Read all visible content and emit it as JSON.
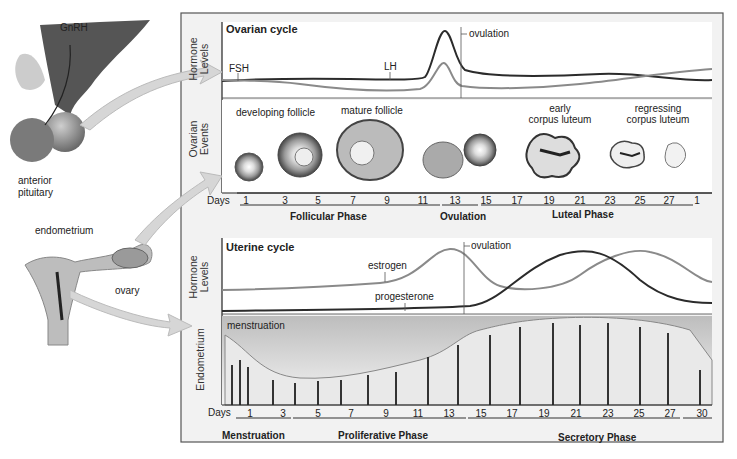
{
  "anatomy": {
    "brain": {
      "gnrh": "GnRH",
      "pituitary_line1": "anterior",
      "pituitary_line2": "pituitary"
    },
    "uterus": {
      "endometrium": "endometrium",
      "ovary": "ovary"
    }
  },
  "ovarian_panel": {
    "title": "Ovarian cycle",
    "axis_hormone": [
      "Hormone",
      "Levels"
    ],
    "axis_events": [
      "Ovarian",
      "Events"
    ],
    "labels": {
      "fsh": "FSH",
      "lh": "LH",
      "ovulation": "ovulation"
    },
    "events": {
      "developing": "developing follicle",
      "mature": "mature follicle",
      "early_cl_1": "early",
      "early_cl_2": "corpus luteum",
      "regress_1": "regressing",
      "regress_2": "corpus luteum"
    },
    "days_label": "Days",
    "days": [
      "1",
      "3",
      "5",
      "7",
      "9",
      "11",
      "13",
      "15",
      "17",
      "19",
      "21",
      "23",
      "25",
      "27",
      "1"
    ],
    "phases": [
      "Follicular Phase",
      "Ovulation",
      "Luteal Phase"
    ]
  },
  "uterine_panel": {
    "title": "Uterine cycle",
    "axis_hormone": [
      "Hormone",
      "Levels"
    ],
    "axis_endometrium": "Endometrium",
    "labels": {
      "estrogen": "estrogen",
      "progesterone": "progesterone",
      "ovulation": "ovulation",
      "menstruation": "menstruation"
    },
    "days_label": "Days",
    "days": [
      "1",
      "3",
      "5",
      "7",
      "9",
      "11",
      "13",
      "15",
      "17",
      "19",
      "21",
      "23",
      "25",
      "27",
      "30"
    ],
    "phases": [
      "Menstruation",
      "Proliferative Phase",
      "Secretory Phase"
    ]
  },
  "colors": {
    "dark_line": "#2b2b2b",
    "light_line": "#8a8a8a",
    "frame": "#555555",
    "panel_bg": "#f2f2f2",
    "arrow": "#d6d6d6"
  }
}
